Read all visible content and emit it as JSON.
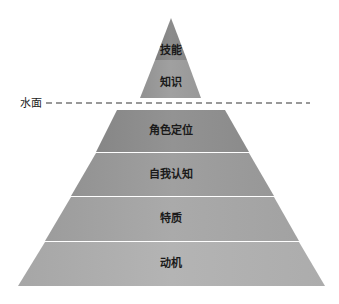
{
  "water_line": {
    "label": "水面"
  },
  "above_water": [
    {
      "label": "技能",
      "color": "#8a8a8a"
    },
    {
      "label": "知识",
      "color": "#9a9a9a"
    }
  ],
  "below_water": [
    {
      "label": "角色定位",
      "color": "#8e8e8e"
    },
    {
      "label": "自我认知",
      "color": "#9b9b9b"
    },
    {
      "label": "特质",
      "color": "#a6a6a6"
    },
    {
      "label": "动机",
      "color": "#b0b0b0"
    }
  ]
}
